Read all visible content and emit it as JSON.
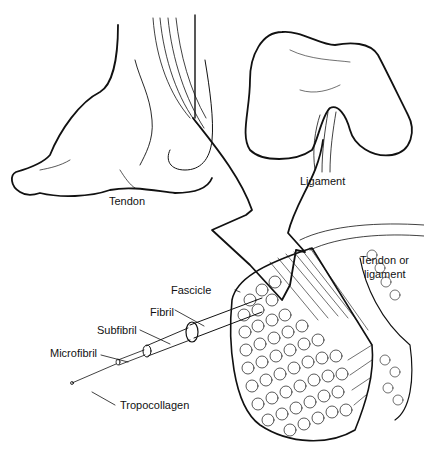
{
  "figure": {
    "type": "anatomical illustration",
    "panels": {
      "foot": {
        "label": "Tendon"
      },
      "knee_bone": {
        "label": "Ligament"
      },
      "cross_section": {
        "label_line1": "Tendon or",
        "label_line2": "ligament"
      }
    },
    "hierarchy_labels": {
      "fascicle": "Fascicle",
      "fibril": "Fibril",
      "subfibril": "Subfibril",
      "microfibril": "Microfibril",
      "tropocollagen": "Tropocollagen"
    },
    "colors": {
      "line": "#111111",
      "background": "#ffffff"
    }
  }
}
